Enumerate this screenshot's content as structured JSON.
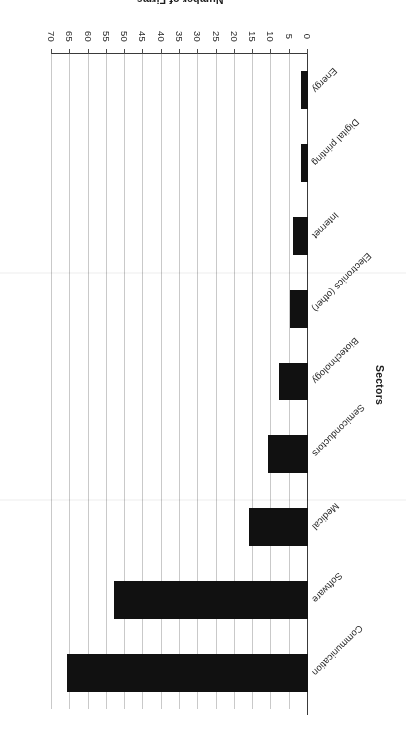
{
  "chart_data": {
    "type": "bar",
    "orientation": "horizontal",
    "title": "",
    "xlabel": "Number of Firms",
    "ylabel": "Sectors",
    "categories": [
      "Communication",
      "Software",
      "Medical",
      "Semiconductors",
      "Biotechnology",
      "Electronics (other)",
      "Internet",
      "Digital printing",
      "Energy"
    ],
    "values": [
      66,
      53,
      16,
      11,
      8,
      5,
      4,
      2,
      2
    ],
    "xlim": [
      0,
      70
    ],
    "xticks": [
      0,
      5,
      10,
      15,
      20,
      25,
      30,
      35,
      40,
      45,
      50,
      55,
      60,
      65,
      70
    ],
    "grid": true,
    "grid_axis": "x",
    "legend": "none",
    "bar_color": "#111111",
    "grid_color": "#c9c9c9",
    "axis_color": "#3a3a3a",
    "page_rotation_degrees": 180
  }
}
